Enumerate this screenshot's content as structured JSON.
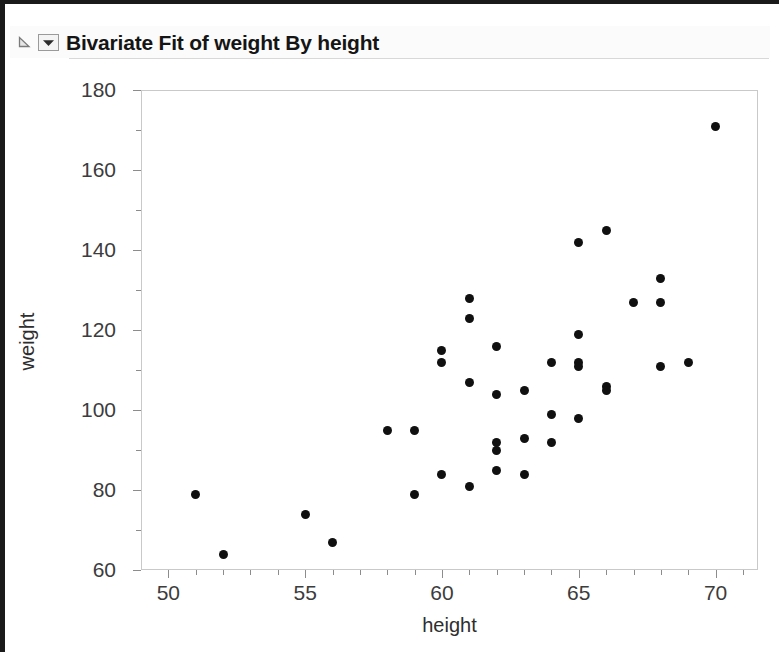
{
  "window": {
    "background_color": "#ffffff",
    "border_color": "#1a1a1a"
  },
  "titlebar": {
    "title": "Bivariate Fit of weight By height",
    "disclosure_icon": "disclosure-triangle-icon",
    "menu_icon": "red-triangle-menu-icon"
  },
  "chart_data": {
    "type": "scatter",
    "title": "Bivariate Fit of weight By height",
    "xlabel": "height",
    "ylabel": "weight",
    "xlim": [
      49.0,
      71.55
    ],
    "ylim": [
      60,
      180
    ],
    "grid": false,
    "legend": null,
    "marker_color": "#101010",
    "marker_size_px": 9,
    "axis_color": "#c9c9c9",
    "tick_color": "#8c8c8c",
    "xticks": [
      50,
      55,
      60,
      65,
      70
    ],
    "xticks_minor": [
      51,
      52,
      53,
      54,
      56,
      57,
      58,
      59,
      61,
      62,
      63,
      64,
      66,
      67,
      68,
      69,
      71
    ],
    "yticks": [
      60,
      80,
      100,
      120,
      140,
      160,
      180
    ],
    "yticks_minor": [
      70,
      90,
      110,
      130,
      150,
      170
    ],
    "xtick_labels": [
      "50",
      "55",
      "60",
      "65",
      "70"
    ],
    "ytick_labels": [
      "60",
      "80",
      "100",
      "120",
      "140",
      "160",
      "180"
    ],
    "n_points": 40,
    "points": [
      {
        "x": 51,
        "y": 79
      },
      {
        "x": 52,
        "y": 64
      },
      {
        "x": 55,
        "y": 74
      },
      {
        "x": 56,
        "y": 67
      },
      {
        "x": 58,
        "y": 95
      },
      {
        "x": 59,
        "y": 95
      },
      {
        "x": 59,
        "y": 79
      },
      {
        "x": 60,
        "y": 115
      },
      {
        "x": 60,
        "y": 112
      },
      {
        "x": 60,
        "y": 84
      },
      {
        "x": 61,
        "y": 128
      },
      {
        "x": 61,
        "y": 123
      },
      {
        "x": 61,
        "y": 107
      },
      {
        "x": 61,
        "y": 81
      },
      {
        "x": 62,
        "y": 116
      },
      {
        "x": 62,
        "y": 104
      },
      {
        "x": 62,
        "y": 92
      },
      {
        "x": 62,
        "y": 90
      },
      {
        "x": 62,
        "y": 85
      },
      {
        "x": 63,
        "y": 105
      },
      {
        "x": 63,
        "y": 93
      },
      {
        "x": 63,
        "y": 84
      },
      {
        "x": 64,
        "y": 112
      },
      {
        "x": 64,
        "y": 99
      },
      {
        "x": 64,
        "y": 92
      },
      {
        "x": 65,
        "y": 142
      },
      {
        "x": 65,
        "y": 119
      },
      {
        "x": 65,
        "y": 112
      },
      {
        "x": 65,
        "y": 111
      },
      {
        "x": 65,
        "y": 98
      },
      {
        "x": 66,
        "y": 145
      },
      {
        "x": 66,
        "y": 106
      },
      {
        "x": 66,
        "y": 105
      },
      {
        "x": 67,
        "y": 127
      },
      {
        "x": 68,
        "y": 133
      },
      {
        "x": 68,
        "y": 127
      },
      {
        "x": 68,
        "y": 111
      },
      {
        "x": 69,
        "y": 112
      },
      {
        "x": 70,
        "y": 171
      }
    ]
  }
}
